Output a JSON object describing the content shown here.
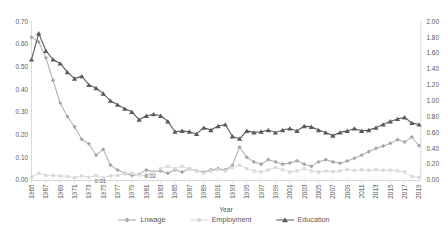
{
  "colors": {
    "text": "#595959",
    "axis_line": "#d9d9d9",
    "background": "#ffffff"
  },
  "chart_data": {
    "type": "line",
    "title": "",
    "xlabel": "Year",
    "grid": false,
    "legend_position": "bottom",
    "x_range": [
      1965,
      2019
    ],
    "x_step": 1,
    "x_tick_labels": [
      "1965",
      "1967",
      "1969",
      "1971",
      "1973",
      "1975",
      "1977",
      "1979",
      "1981",
      "1983",
      "1985",
      "1987",
      "1989",
      "1991",
      "1993",
      "1995",
      "1997",
      "1999",
      "2001",
      "2003",
      "2005",
      "2007",
      "2009",
      "2011",
      "2013",
      "2015",
      "2017",
      "2019"
    ],
    "left_axis": {
      "min": 0.0,
      "max": 0.7,
      "tick_labels": [
        "0.00",
        "0.10",
        "0.20",
        "0.30",
        "0.40",
        "0.50",
        "0.60",
        "0.70"
      ]
    },
    "right_axis": {
      "min": 0.0,
      "max": 2.0,
      "tick_labels": [
        "0.00",
        "0.20",
        "0.40",
        "0.60",
        "0.80",
        "1.00",
        "1.20",
        "1.40",
        "1.60",
        "1.80",
        "2.00"
      ]
    },
    "series": [
      {
        "name": "Lnwage",
        "axis": "left",
        "color": "#a6a6a6",
        "marker": "diamond",
        "values": [
          0.63,
          0.61,
          0.54,
          0.44,
          0.34,
          0.28,
          0.235,
          0.18,
          0.16,
          0.11,
          0.135,
          0.066,
          0.044,
          0.03,
          0.02,
          0.025,
          0.044,
          0.037,
          0.04,
          0.03,
          0.045,
          0.035,
          0.05,
          0.04,
          0.035,
          0.045,
          0.05,
          0.045,
          0.065,
          0.145,
          0.1,
          0.08,
          0.07,
          0.09,
          0.08,
          0.07,
          0.075,
          0.085,
          0.07,
          0.06,
          0.08,
          0.09,
          0.08,
          0.074,
          0.084,
          0.096,
          0.11,
          0.125,
          0.14,
          0.15,
          0.162,
          0.178,
          0.168,
          0.19,
          0.152
        ]
      },
      {
        "name": "Employment",
        "axis": "left",
        "color": "#d9d9d9",
        "marker": "square",
        "values": [
          0.013,
          0.03,
          0.02,
          0.02,
          0.018,
          0.015,
          0.01,
          0.018,
          0.012,
          0.02,
          0.01,
          0.018,
          0.02,
          0.027,
          0.03,
          0.022,
          0.02,
          0.035,
          0.05,
          0.06,
          0.05,
          0.06,
          0.05,
          0.04,
          0.03,
          0.04,
          0.045,
          0.04,
          0.055,
          0.065,
          0.05,
          0.04,
          0.035,
          0.045,
          0.055,
          0.045,
          0.035,
          0.04,
          0.05,
          0.04,
          0.035,
          0.04,
          0.037,
          0.04,
          0.047,
          0.043,
          0.045,
          0.043,
          0.045,
          0.043,
          0.043,
          0.04,
          0.036,
          0.015,
          0.012
        ]
      },
      {
        "name": "Education",
        "axis": "right",
        "color": "#595959",
        "marker": "triangle",
        "values": [
          1.52,
          1.85,
          1.63,
          1.52,
          1.47,
          1.36,
          1.28,
          1.31,
          1.2,
          1.16,
          1.09,
          1.0,
          0.95,
          0.9,
          0.86,
          0.76,
          0.81,
          0.83,
          0.81,
          0.74,
          0.61,
          0.62,
          0.61,
          0.58,
          0.66,
          0.63,
          0.68,
          0.7,
          0.55,
          0.52,
          0.62,
          0.6,
          0.61,
          0.63,
          0.6,
          0.63,
          0.65,
          0.62,
          0.68,
          0.67,
          0.63,
          0.6,
          0.56,
          0.6,
          0.62,
          0.65,
          0.62,
          0.63,
          0.66,
          0.7,
          0.74,
          0.77,
          0.79,
          0.72,
          0.7
        ]
      }
    ],
    "annotations": [
      {
        "label": "0.01",
        "series": "Employment",
        "year": 1975,
        "dx": -3,
        "dy": 5.2
      },
      {
        "label": "0.02",
        "series": "Employment",
        "year": 1981,
        "dx": 4,
        "dy": 2.6
      }
    ]
  }
}
